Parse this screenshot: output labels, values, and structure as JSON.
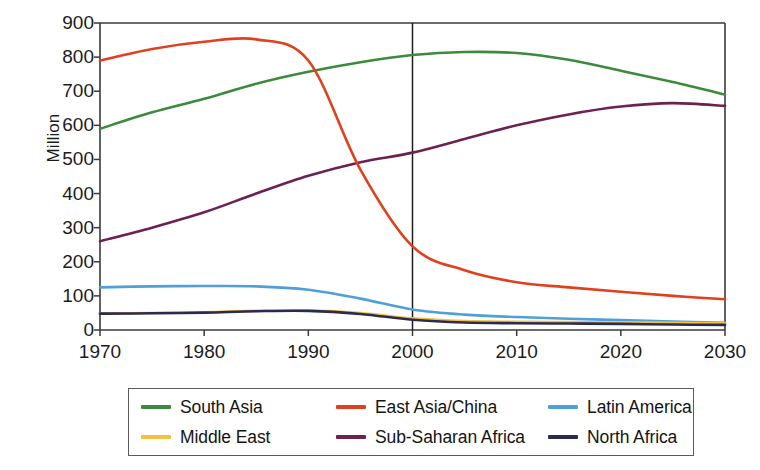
{
  "chart_data": {
    "type": "line",
    "title": "",
    "xlabel": "",
    "ylabel": "Million",
    "xlim": [
      1970,
      2030
    ],
    "ylim": [
      0,
      900
    ],
    "grid": false,
    "legend_position": "bottom",
    "x_ticks": [
      "1970",
      "1980",
      "1990",
      "2000",
      "2010",
      "2020",
      "2030"
    ],
    "y_ticks": [
      "0",
      "100",
      "200",
      "300",
      "400",
      "500",
      "600",
      "700",
      "800",
      "900"
    ],
    "annotations": [
      {
        "name": "projection-divider",
        "type": "vertical-line",
        "x": 2000,
        "label": ""
      }
    ],
    "x": [
      1970,
      1975,
      1980,
      1985,
      1990,
      1995,
      2000,
      2005,
      2010,
      2015,
      2020,
      2025,
      2030
    ],
    "series": [
      {
        "name": "South Asia",
        "color": "#3c8a3e",
        "values": [
          590,
          638,
          678,
          722,
          757,
          785,
          806,
          815,
          812,
          792,
          760,
          727,
          690
        ]
      },
      {
        "name": "East Asia/China",
        "color": "#e0401d",
        "values": [
          790,
          824,
          845,
          852,
          790,
          470,
          245,
          175,
          140,
          125,
          112,
          100,
          90
        ]
      },
      {
        "name": "Latin America",
        "color": "#4f9fd8",
        "values": [
          125,
          128,
          129,
          128,
          118,
          92,
          60,
          45,
          38,
          33,
          29,
          25,
          21
        ]
      },
      {
        "name": "Middle East",
        "color": "#f2c141",
        "values": [
          48,
          50,
          52,
          56,
          57,
          50,
          34,
          26,
          24,
          23,
          22,
          21,
          20
        ]
      },
      {
        "name": "Sub-Saharan Africa",
        "color": "#6d2150",
        "values": [
          260,
          300,
          345,
          400,
          452,
          492,
          520,
          560,
          600,
          632,
          655,
          665,
          657
        ]
      },
      {
        "name": "North Africa",
        "color": "#2b2b52",
        "values": [
          48,
          49,
          51,
          55,
          56,
          47,
          30,
          22,
          20,
          19,
          18,
          16,
          15
        ]
      }
    ]
  },
  "axes": {
    "ylabel": "Million"
  },
  "legend": {
    "items": [
      {
        "label": "South Asia",
        "color": "#3c8a3e"
      },
      {
        "label": "East Asia/China",
        "color": "#e0401d"
      },
      {
        "label": "Latin America",
        "color": "#4f9fd8"
      },
      {
        "label": "Middle East",
        "color": "#f2c141"
      },
      {
        "label": "Sub-Saharan Africa",
        "color": "#6d2150"
      },
      {
        "label": "North Africa",
        "color": "#2b2b52"
      }
    ]
  }
}
